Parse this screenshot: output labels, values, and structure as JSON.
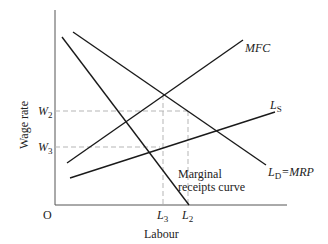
{
  "diagram": {
    "axes": {
      "y_label": "Wage rate",
      "x_label": "Labour",
      "origin": "O"
    },
    "y_ticks": [
      {
        "main": "W",
        "sub": "2"
      },
      {
        "main": "W",
        "sub": "3"
      }
    ],
    "x_ticks": [
      {
        "main": "L",
        "sub": "3"
      },
      {
        "main": "L",
        "sub": "2"
      }
    ],
    "curves": {
      "mfc": {
        "label": "MFC"
      },
      "ls": {
        "main": "L",
        "sub": "S"
      },
      "ld": {
        "main": "L",
        "sub": "D",
        "suffix": "=MRP"
      },
      "mrc": {
        "line1": "Marginal",
        "line2": "receipts curve"
      }
    },
    "colors": {
      "line": "#1a1a1a",
      "dashed": "#b5b5b5",
      "axis": "#555555"
    }
  }
}
